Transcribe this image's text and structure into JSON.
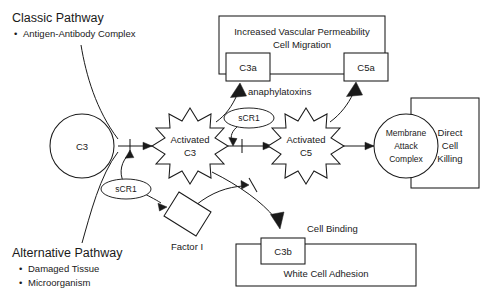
{
  "figure": {
    "title_visible": false,
    "background_color": "#ffffff",
    "line_color": "#1a1a1a",
    "type": "flowchart-diagram"
  },
  "headings": {
    "classic_pathway": {
      "title": "Classic Pathway",
      "bullets": [
        "Antigen-Antibody Complex"
      ]
    },
    "alternative_pathway": {
      "title": "Alternative Pathway",
      "bullets": [
        "Damaged Tissue",
        "Microorganism"
      ]
    }
  },
  "nodes": {
    "c3": {
      "label": "C3",
      "shape": "circle"
    },
    "activated_c3": {
      "label_line1": "Activated",
      "label_line2": "C3",
      "shape": "starburst"
    },
    "activated_c5": {
      "label_line1": "Activated",
      "label_line2": "C5",
      "shape": "starburst"
    },
    "scr1_left": {
      "label": "sCR1",
      "shape": "ellipse"
    },
    "scr1_right": {
      "label": "sCR1",
      "shape": "ellipse"
    },
    "c3a": {
      "label": "C3a",
      "shape": "rect"
    },
    "c5a": {
      "label": "C5a",
      "shape": "rect"
    },
    "c3b": {
      "label": "C3b",
      "shape": "rect"
    },
    "factor_i": {
      "label": "Factor I",
      "shape": "tilted-rect"
    },
    "membrane_attack_complex": {
      "label_line1": "Membrane",
      "label_line2": "Attack",
      "label_line3": "Complex",
      "shape": "circle"
    },
    "direct_cell_killing": {
      "label_line1": "Direct",
      "label_line2": "Cell",
      "label_line3": "Killing",
      "shape": "rect"
    },
    "vascular_effects": {
      "label_line1": "Increased Vascular Permeability",
      "label_line2": "Cell Migration",
      "shape": "rect"
    },
    "white_cell_adhesion": {
      "label": "White Cell Adhesion",
      "shape": "rect"
    }
  },
  "annotations": {
    "anaphylatoxins": "anaphylatoxins",
    "cell_binding": "Cell Binding"
  }
}
